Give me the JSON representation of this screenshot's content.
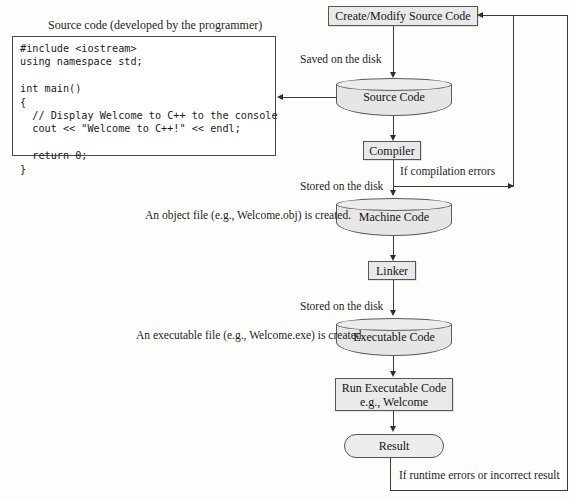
{
  "diagram": {
    "code_panel": {
      "caption": "Source code (developed by the programmer)",
      "code": "#include <iostream>\nusing namespace std;\n\nint main()\n{\n  // Display Welcome to C++ to the console\n  cout << \"Welcome to C++!\" << endl;\n\n  return 0;\n}"
    },
    "nodes": {
      "create_modify": "Create/Modify Source Code",
      "source_code": "Source Code",
      "compiler": "Compiler",
      "machine_code": "Machine Code",
      "linker": "Linker",
      "executable_code": "Executable Code",
      "run_executable": "Run Executable Code\ne.g., Welcome",
      "result": "Result"
    },
    "edge_labels": {
      "saved_on_disk": "Saved on the disk",
      "stored_on_disk_1": "Stored on the disk",
      "stored_on_disk_2": "Stored on the disk",
      "compilation_errors": "If compilation errors",
      "runtime_errors": "If runtime errors or incorrect result",
      "object_file_note": "An object file (e.g., Welcome.obj) is created.",
      "executable_file_note": "An executable file (e.g., Welcome.exe) is created."
    },
    "colors": {
      "node_fill": "#e9e9e9",
      "node_stroke": "#565656",
      "line": "#3b3b3b",
      "page_bg": "#fdfdfc",
      "text": "#141414"
    }
  }
}
